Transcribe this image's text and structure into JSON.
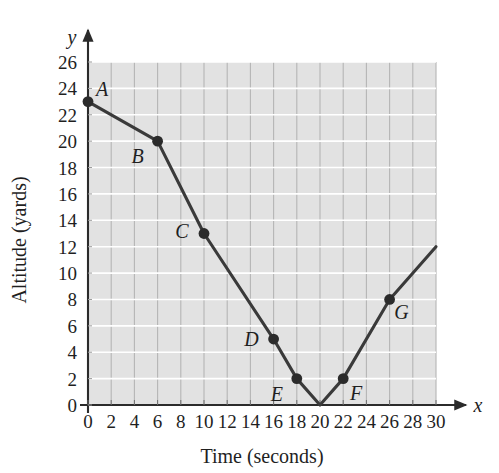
{
  "chart_data": {
    "type": "line",
    "title": "",
    "xlabel": "Time (seconds)",
    "ylabel": "Altitude (yards)",
    "x_axis_variable": "x",
    "y_axis_variable": "y",
    "xlim": [
      0,
      30
    ],
    "ylim": [
      0,
      26
    ],
    "xticks": [
      0,
      2,
      4,
      6,
      8,
      10,
      12,
      14,
      16,
      18,
      20,
      22,
      24,
      26,
      28,
      30
    ],
    "yticks": [
      0,
      2,
      4,
      6,
      8,
      10,
      12,
      14,
      16,
      18,
      20,
      22,
      24,
      26
    ],
    "xtick_labels": [
      "0",
      "2",
      "4",
      "6",
      "8",
      "10",
      "12",
      "14",
      "16",
      "18",
      "20",
      "22",
      "24",
      "26",
      "28",
      "30"
    ],
    "ytick_labels": [
      "0",
      "2",
      "4",
      "6",
      "8",
      "10",
      "12",
      "14",
      "16",
      "18",
      "20",
      "22",
      "24",
      "26"
    ],
    "grid": true,
    "grid_vertical_step": 2,
    "grid_horizontal_step": 2,
    "legend": false,
    "plot_bg_color": "#e2e2e2",
    "grid_vertical_color": "#b5b5b5",
    "grid_horizontal_color": "#ffffff",
    "line_color": "#3a3a3a",
    "marker_color": "#2b2b2b",
    "series": [
      {
        "name": "Altitude vs Time",
        "x": [
          0,
          6,
          10,
          16,
          18,
          20,
          22,
          26,
          30
        ],
        "y": [
          23,
          20,
          13,
          5,
          2,
          0,
          2,
          8,
          12
        ]
      }
    ],
    "labeled_points": [
      {
        "label": "A",
        "x": 0,
        "y": 23,
        "label_dx": 14,
        "label_dy": -6
      },
      {
        "label": "B",
        "x": 6,
        "y": 20,
        "label_dx": -20,
        "label_dy": 22
      },
      {
        "label": "C",
        "x": 10,
        "y": 13,
        "label_dx": -22,
        "label_dy": 4
      },
      {
        "label": "D",
        "x": 16,
        "y": 5,
        "label_dx": -22,
        "label_dy": 7
      },
      {
        "label": "E",
        "x": 18,
        "y": 2,
        "label_dx": -20,
        "label_dy": 22
      },
      {
        "label": "F",
        "x": 22,
        "y": 2,
        "label_dx": 13,
        "label_dy": 21
      },
      {
        "label": "G",
        "x": 26,
        "y": 8,
        "label_dx": 12,
        "label_dy": 20
      }
    ],
    "unlabeled_vertices": [
      {
        "x": 20,
        "y": 0
      },
      {
        "x": 30,
        "y": 12
      }
    ]
  }
}
